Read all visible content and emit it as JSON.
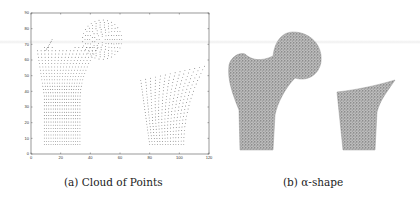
{
  "figure": {
    "captions": {
      "a": "(a) Cloud of Points",
      "b": "(b) α-shape"
    }
  },
  "chart_data": [
    {
      "type": "scatter",
      "title": "(a) Cloud of Points",
      "xlabel": "",
      "ylabel": "",
      "xlim": [
        0,
        120
      ],
      "ylim": [
        0,
        90
      ],
      "xticks": [
        0,
        20,
        40,
        60,
        80,
        100,
        120
      ],
      "yticks": [
        0,
        10,
        20,
        30,
        40,
        50,
        60,
        70,
        80,
        90
      ],
      "grid": false,
      "series": [
        {
          "name": "proximal femur (head, neck, shaft)",
          "description": "dense structured point cloud; shaft x≈9–33, y≈6–38; trochanter up to (12,74); head circle centered ≈(48,73) r≈14"
        },
        {
          "name": "distal fragment",
          "description": "trapezoidal point cloud; bottom x≈80–103 at y≈6; top edge from (74,47) to (117,56)"
        }
      ]
    },
    {
      "type": "scatter",
      "title": "(b) α-shape",
      "description": "triangulated alpha-shape surface rendering of same two bone pieces, no axes"
    }
  ]
}
